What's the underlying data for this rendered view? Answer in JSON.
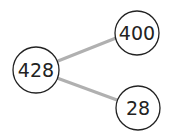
{
  "diagram": {
    "type": "number-bond",
    "whole": {
      "label": "428",
      "cx": 36,
      "cy": 70,
      "r": 23
    },
    "parts": [
      {
        "label": "400",
        "cx": 137,
        "cy": 33,
        "r": 22
      },
      {
        "label": "28",
        "cx": 138,
        "cy": 108,
        "r": 22
      }
    ],
    "colors": {
      "connector": "#b0b0b0",
      "circle_stroke": "#222222",
      "circle_fill": "#ffffff",
      "text": "#222222"
    }
  }
}
